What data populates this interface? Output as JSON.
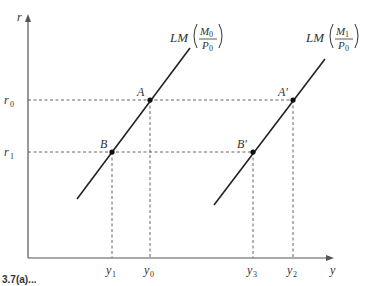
{
  "diagram": {
    "axes": {
      "y_label": "r",
      "x_label": "y"
    },
    "y_ticks": [
      {
        "label": "r",
        "sub": "0"
      },
      {
        "label": "r",
        "sub": "1"
      }
    ],
    "x_ticks": [
      {
        "label": "y",
        "sub": "1"
      },
      {
        "label": "y",
        "sub": "0"
      },
      {
        "label": "y",
        "sub": "3"
      },
      {
        "label": "y",
        "sub": "2"
      }
    ],
    "curves": [
      {
        "name": "LM",
        "numerator": "M",
        "numerator_sub": "0",
        "denominator": "P",
        "denominator_sub": "0"
      },
      {
        "name": "LM",
        "numerator": "M",
        "numerator_sub": "1",
        "denominator": "P",
        "denominator_sub": "0"
      }
    ],
    "points": [
      {
        "label": "A"
      },
      {
        "label": "B"
      },
      {
        "label": "A′"
      },
      {
        "label": "B′"
      }
    ],
    "caption": "3.7(a)..."
  },
  "colors": {
    "line": "#222222",
    "axis": "#555555",
    "background": "#ffffff"
  }
}
